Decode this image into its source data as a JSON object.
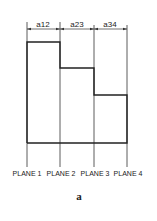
{
  "diagram": {
    "caption": "a",
    "planes": [
      {
        "label": "PLANE 1"
      },
      {
        "label": "PLANE 2"
      },
      {
        "label": "PLANE 3"
      },
      {
        "label": "PLANE 4"
      }
    ],
    "dimensions": [
      {
        "label": "a12"
      },
      {
        "label": "a23"
      },
      {
        "label": "a34"
      }
    ],
    "line_color": "#222222"
  }
}
